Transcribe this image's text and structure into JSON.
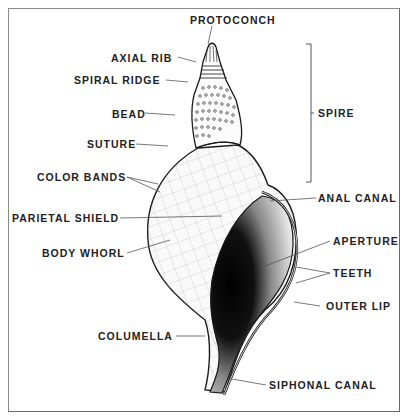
{
  "diagram": {
    "colors": {
      "ink": "#1a1a1a",
      "leader": "#555555",
      "frame": "#7a7a7a",
      "background": "#ffffff"
    },
    "labels": {
      "protoconch": "PROTOCONCH",
      "axial_rib": "AXIAL RIB",
      "spiral_ridge": "SPIRAL RIDGE",
      "bead": "BEAD",
      "suture": "SUTURE",
      "color_bands": "COLOR BANDS",
      "parietal_shield": "PARIETAL SHIELD",
      "body_whorl": "BODY WHORL",
      "columella": "COLUMELLA",
      "spire": "SPIRE",
      "anal_canal": "ANAL CANAL",
      "aperture": "APERTURE",
      "teeth": "TEETH",
      "outer_lip": "OUTER LIP",
      "siphonal_canal": "SIPHONAL CANAL"
    }
  }
}
